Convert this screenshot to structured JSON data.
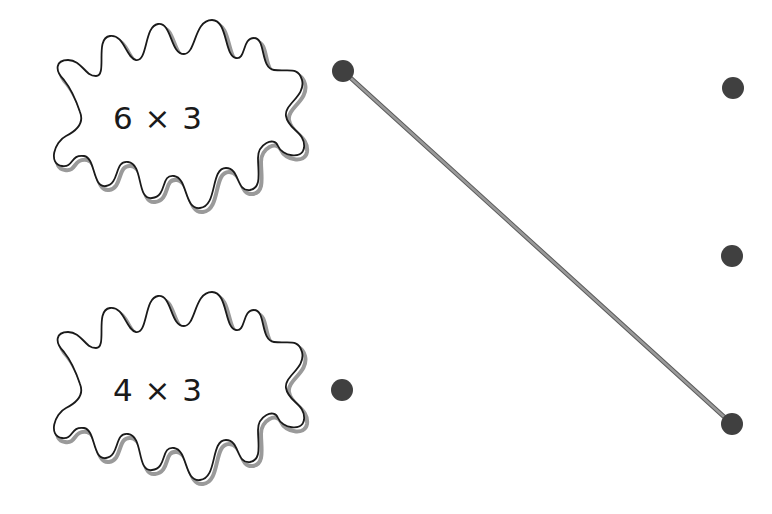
{
  "exercise": {
    "type": "match-the-product",
    "problems": [
      {
        "id": "p1",
        "expression": "6 × 3",
        "dot": {
          "x": 343,
          "y": 71
        }
      },
      {
        "id": "p2",
        "expression": "4 × 3",
        "dot": {
          "x": 342,
          "y": 390
        }
      }
    ],
    "answer_dots": [
      {
        "id": "a1",
        "x": 733,
        "y": 88
      },
      {
        "id": "a2",
        "x": 732,
        "y": 256
      },
      {
        "id": "a3",
        "x": 732,
        "y": 424
      }
    ],
    "connections": [
      {
        "from": "p1",
        "to": "a3",
        "x1": 343,
        "y1": 71,
        "x2": 732,
        "y2": 424
      }
    ]
  },
  "colors": {
    "outline": "#1a1a1a",
    "shadow": "#9a9a9a",
    "dot": "#404040",
    "line": "#8a8a8a",
    "line_shadow": "#5a5a5a"
  }
}
